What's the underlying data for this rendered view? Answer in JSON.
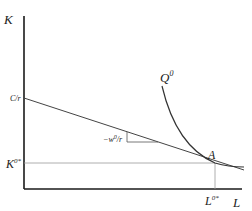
{
  "diagram": {
    "type": "isoquant-isocost",
    "axes": {
      "y_label": "K",
      "x_label": "L"
    },
    "labels": {
      "intercept": "C/r",
      "isoquant": "Q",
      "isoquant_sup": "0",
      "slope": "−w",
      "slope_sup": "0",
      "slope_den": "/r",
      "optimum": "A",
      "k_star": "K",
      "k_star_sup": "0*",
      "l_star": "L",
      "l_star_sup": "0*"
    },
    "colors": {
      "axis": "#1a1a1a",
      "line": "#444444",
      "guide": "#999999"
    }
  }
}
